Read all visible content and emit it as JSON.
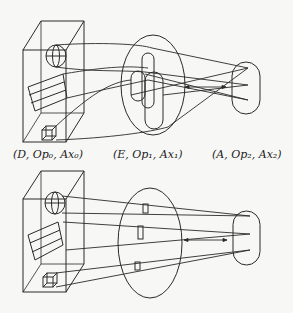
{
  "diagram": {
    "top_panel": {
      "labels": {
        "left": "(D, Op₀, Ax₀)",
        "middle": "(E, Op₁, Ax₁)",
        "right": "(A, Op₂, Ax₂)"
      },
      "description": "Data box (D) with sphere, slab and cube projected through an overlapping set of regions E to action set A; crossing lines with bidirectional arrow"
    },
    "bottom_panel": {
      "description": "Same data box projected through separated small regions in E to A; parallel lines with bidirectional arrow"
    },
    "stroke_color": "#2a2a2a",
    "background_color": "#f7f7f5"
  }
}
